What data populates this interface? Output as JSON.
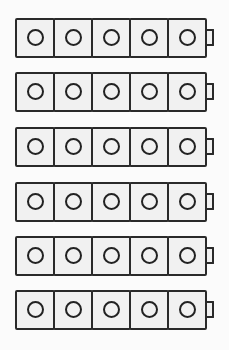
{
  "figure": {
    "trains": [
      {
        "cubes": 5,
        "top": 18
      },
      {
        "cubes": 5,
        "top": 72
      },
      {
        "cubes": 5,
        "top": 127
      },
      {
        "cubes": 5,
        "top": 182
      },
      {
        "cubes": 5,
        "top": 236
      },
      {
        "cubes": 5,
        "top": 290
      }
    ],
    "colors": {
      "outline": "#2a2a2a",
      "fill": "#f1f1f1",
      "background": "#fbfbfb"
    }
  }
}
